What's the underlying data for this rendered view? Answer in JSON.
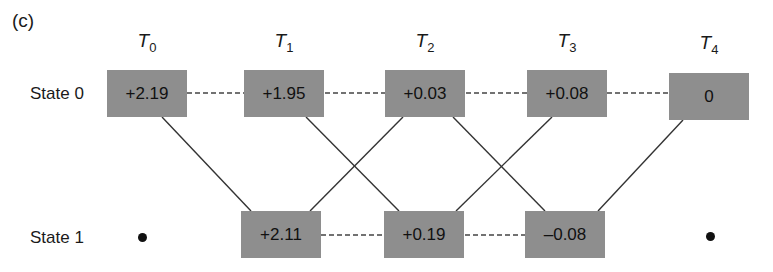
{
  "panel_label": "(c)",
  "time_steps": [
    {
      "base": "T",
      "sub": "0"
    },
    {
      "base": "T",
      "sub": "1"
    },
    {
      "base": "T",
      "sub": "2"
    },
    {
      "base": "T",
      "sub": "3"
    },
    {
      "base": "T",
      "sub": "4"
    }
  ],
  "states": [
    {
      "label": "State 0",
      "values": [
        "+2.19",
        "+1.95",
        "+0.03",
        "+0.08",
        "0"
      ]
    },
    {
      "label": "State 1",
      "values": [
        "•",
        "+2.11",
        "+0.19",
        "–0.08",
        "•"
      ]
    }
  ],
  "colors": {
    "box_fill": "#8e8e8e",
    "line": "#333333",
    "background": "#ffffff"
  }
}
